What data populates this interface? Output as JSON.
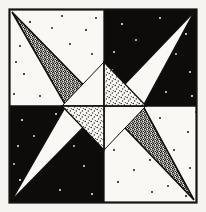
{
  "artwork": {
    "title": "Stippled Pinwheel Star Pattern",
    "medium": "pen-and-ink stipple drawing",
    "canvas": {
      "width": 206,
      "height": 212
    },
    "frame": {
      "name": "outer-frame",
      "x": 9,
      "y": 9,
      "width": 188,
      "height": 194,
      "stroke": "#151210",
      "stroke_width": 2.2
    },
    "palette": {
      "paper": "#f6f4f0",
      "ink": "#131110",
      "black_fill": "#0d0c0b",
      "white_fill": "#faf8f5",
      "stipple_dark": "#1a1816",
      "stipple_light": "#2a2724",
      "page_background": "#f2f0ec"
    },
    "grid": {
      "center_x": 104,
      "center_y": 106,
      "vertical_divider_x": 104,
      "horizontal_divider_y": 106,
      "quadrant_label_order": [
        "top-left",
        "top-right",
        "bottom-left",
        "bottom-right"
      ]
    },
    "quadrants": [
      {
        "name": "quadrant-top-left",
        "background": "white",
        "x": 10,
        "y": 10,
        "width": 94,
        "height": 96
      },
      {
        "name": "quadrant-top-right",
        "background": "black",
        "x": 104,
        "y": 10,
        "width": 92,
        "height": 96
      },
      {
        "name": "quadrant-bottom-left",
        "background": "black",
        "x": 10,
        "y": 106,
        "width": 94,
        "height": 96
      },
      {
        "name": "quadrant-bottom-right",
        "background": "white",
        "x": 104,
        "y": 106,
        "width": 92,
        "height": 96
      }
    ],
    "shapes": [
      {
        "name": "large-triangle-upper-left",
        "fill_style": "dense-stipple",
        "points": "12,12 104,106 66,106"
      },
      {
        "name": "large-triangle-upper-right",
        "fill_style": "solid-white",
        "points": "194,12 104,106 143,106"
      },
      {
        "name": "large-triangle-lower-left",
        "fill_style": "solid-white",
        "points": "12,200 104,106 66,106"
      },
      {
        "name": "large-triangle-lower-right",
        "fill_style": "dense-stipple",
        "points": "194,200 104,106 143,106"
      },
      {
        "name": "inner-triangle-top-right",
        "fill_style": "sparse-stipple",
        "points": "104,62 146,106 104,106"
      },
      {
        "name": "inner-triangle-bottom-left",
        "fill_style": "sparse-stipple",
        "points": "104,150 62,106 104,106"
      },
      {
        "name": "inner-triangle-top-left",
        "fill_style": "solid-white",
        "points": "104,62 62,106 104,106"
      },
      {
        "name": "inner-triangle-bottom-right",
        "fill_style": "solid-white",
        "points": "104,150 146,106 104,106"
      }
    ],
    "scatter_dots": {
      "name": "background-speckle-dots",
      "description": "small ink flecks scattered across quadrant backgrounds",
      "count": 78,
      "radius": 1.1
    }
  }
}
